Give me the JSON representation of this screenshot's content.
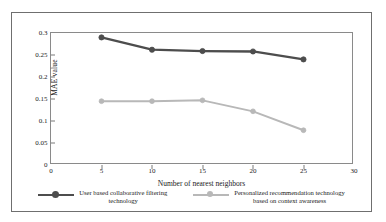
{
  "chart_data": {
    "type": "line",
    "title": "",
    "xlabel": "Number of nearest neighbors",
    "ylabel": "MAE value",
    "x": [
      5,
      10,
      15,
      20,
      25
    ],
    "xlim": [
      0,
      30
    ],
    "ylim": [
      0,
      0.3
    ],
    "xticks": [
      "0",
      "5",
      "10",
      "15",
      "20",
      "25",
      "30"
    ],
    "xtick_values": [
      0,
      5,
      10,
      15,
      20,
      25,
      30
    ],
    "yticks": [
      "0",
      "0.05",
      "0.1",
      "0.15",
      "0.2",
      "0.25",
      "0.3"
    ],
    "ytick_values": [
      0,
      0.05,
      0.1,
      0.15,
      0.2,
      0.25,
      0.3
    ],
    "grid": false,
    "legend_position": "bottom",
    "series": [
      {
        "name": "User based collaborative filtering\ntechnology",
        "color": "#4d4d4d",
        "marker": "circle",
        "values": [
          0.29,
          0.262,
          0.259,
          0.258,
          0.24
        ]
      },
      {
        "name": "Personalized recommendation technology\nbased on context awareness",
        "color": "#b8b8b8",
        "marker": "circle",
        "values": [
          0.145,
          0.145,
          0.147,
          0.122,
          0.079
        ]
      }
    ]
  },
  "figure": {
    "border_color": "#6f6f6f",
    "axis_color": "#8a8a8a",
    "background": "#ffffff"
  }
}
